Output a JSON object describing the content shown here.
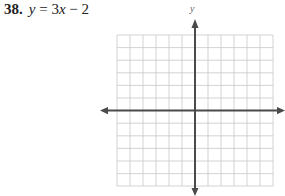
{
  "problem": {
    "number": "38.",
    "equation_parts": [
      "y",
      " = 3",
      "x",
      " − 2"
    ],
    "equation": "y = 3x − 2"
  },
  "graph": {
    "y_axis_label": "y",
    "grid_columns": 12,
    "grid_rows": 12,
    "grid_color": "#c8c8c8",
    "axis_color": "#4a4a4a"
  }
}
